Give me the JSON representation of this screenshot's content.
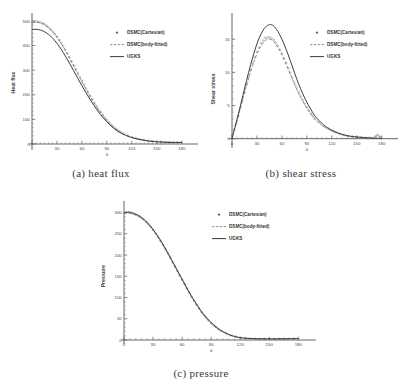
{
  "figure": {
    "background": "#ffffff",
    "legend_labels": [
      "DSMC(Cartesian)",
      "DSMC(body-fitted)",
      "UGKS"
    ],
    "series_colors": {
      "dsmc_cartesian": "#8a8a8a",
      "dsmc_body_fitted": "#6a6a6a",
      "ugks": "#3c3c3c"
    }
  },
  "panels": [
    {
      "id": "a",
      "caption": "(a)  heat flux"
    },
    {
      "id": "b",
      "caption": "(b)  shear stress"
    },
    {
      "id": "c",
      "caption": "(c)  pressure"
    }
  ],
  "chart_data": [
    {
      "type": "line",
      "panel": "a",
      "title": "",
      "caption": "(a)  heat flux",
      "xlabel": "θ",
      "ylabel": "Heat flux",
      "xlim": [
        0,
        190
      ],
      "ylim": [
        0,
        520
      ],
      "xticks": [
        0,
        30,
        60,
        90,
        120,
        150,
        180
      ],
      "yticks": [
        0,
        100,
        200,
        300,
        400,
        500
      ],
      "xtick_labels": [
        "0",
        "30",
        "60",
        "90",
        "120",
        "150",
        "180"
      ],
      "ytick_labels": [
        "0",
        "100",
        "200",
        "300",
        "400",
        "500"
      ],
      "minor_ticks_per_interval": 6,
      "grid": false,
      "legend_position": "upper-right",
      "x": [
        0,
        5,
        10,
        15,
        20,
        25,
        30,
        35,
        40,
        45,
        50,
        55,
        60,
        65,
        70,
        75,
        80,
        85,
        90,
        95,
        100,
        105,
        110,
        120,
        130,
        140,
        150,
        160,
        170,
        180
      ],
      "series": [
        {
          "name": "DSMC(Cartesian)",
          "style": "points",
          "values": [
            497,
            498,
            494,
            487,
            474,
            457,
            436,
            411,
            383,
            352,
            320,
            288,
            256,
            225,
            195,
            167,
            141,
            118,
            97,
            79,
            64,
            52,
            42,
            28,
            19,
            13,
            10,
            8,
            7,
            7
          ]
        },
        {
          "name": "DSMC(body-fitted)",
          "style": "dashed",
          "values": [
            492,
            495,
            492,
            485,
            472,
            455,
            434,
            409,
            381,
            350,
            318,
            286,
            254,
            223,
            194,
            166,
            140,
            117,
            96,
            78,
            63,
            51,
            41,
            27,
            18,
            13,
            10,
            8,
            7,
            7
          ]
        },
        {
          "name": "UGKS",
          "style": "solid",
          "values": [
            465,
            466,
            463,
            456,
            445,
            429,
            409,
            385,
            358,
            329,
            298,
            267,
            237,
            208,
            180,
            154,
            130,
            109,
            90,
            73,
            59,
            48,
            39,
            26,
            18,
            12,
            9,
            7,
            6,
            6
          ]
        }
      ]
    },
    {
      "type": "line",
      "panel": "b",
      "title": "",
      "caption": "(b)  shear stress",
      "xlabel": "θ",
      "ylabel": "Shear stress",
      "xlim": [
        0,
        190
      ],
      "ylim": [
        -0.8,
        18.5
      ],
      "xticks": [
        0,
        30,
        60,
        90,
        120,
        150,
        180
      ],
      "yticks": [
        0,
        5,
        10,
        15
      ],
      "xtick_labels": [
        "0",
        "30",
        "60",
        "90",
        "120",
        "150",
        "180"
      ],
      "ytick_labels": [
        "0",
        "5",
        "10",
        "15"
      ],
      "minor_ticks_per_interval": 5,
      "grid": false,
      "legend_position": "upper-right",
      "x": [
        0,
        5,
        10,
        15,
        20,
        25,
        30,
        35,
        40,
        45,
        50,
        55,
        60,
        65,
        70,
        75,
        80,
        85,
        90,
        95,
        100,
        110,
        120,
        130,
        140,
        150,
        160,
        170,
        175,
        180
      ],
      "series": [
        {
          "name": "DSMC(Cartesian)",
          "style": "points",
          "values": [
            0.5,
            2.3,
            4.6,
            7.0,
            9.3,
            11.4,
            13.1,
            14.4,
            15.2,
            15.3,
            14.9,
            14.0,
            12.8,
            11.4,
            9.9,
            8.4,
            7.0,
            5.8,
            4.7,
            3.8,
            3.0,
            1.9,
            1.2,
            0.7,
            0.4,
            0.25,
            0.15,
            0.1,
            0.6,
            0.05
          ]
        },
        {
          "name": "DSMC(body-fitted)",
          "style": "dashed",
          "values": [
            0.4,
            2.2,
            4.5,
            6.9,
            9.1,
            11.1,
            12.8,
            14.0,
            14.8,
            15.0,
            14.7,
            13.8,
            12.7,
            11.3,
            9.8,
            8.3,
            6.9,
            5.7,
            4.6,
            3.7,
            2.9,
            1.85,
            1.15,
            0.68,
            0.38,
            0.24,
            0.14,
            0.09,
            0.5,
            0.05
          ]
        },
        {
          "name": "UGKS",
          "style": "solid",
          "values": [
            0.0,
            2.4,
            4.9,
            7.5,
            10.0,
            12.3,
            14.3,
            15.8,
            16.8,
            17.2,
            17.0,
            16.2,
            15.0,
            13.5,
            11.8,
            10.0,
            8.3,
            6.8,
            5.5,
            4.4,
            3.4,
            2.1,
            1.3,
            0.75,
            0.42,
            0.26,
            0.15,
            0.08,
            0.05,
            0.02
          ]
        }
      ]
    },
    {
      "type": "line",
      "panel": "c",
      "title": "",
      "caption": "(c)  pressure",
      "xlabel": "θ",
      "ylabel": "Pressure",
      "xlim": [
        0,
        190
      ],
      "ylim": [
        0,
        320
      ],
      "xticks": [
        0,
        30,
        60,
        90,
        120,
        150,
        180
      ],
      "yticks": [
        0,
        50,
        100,
        150,
        200,
        250,
        300
      ],
      "xtick_labels": [
        "0",
        "30",
        "60",
        "90",
        "120",
        "150",
        "180"
      ],
      "ytick_labels": [
        "0",
        "50",
        "100",
        "150",
        "200",
        "250",
        "300"
      ],
      "minor_ticks_per_interval": 5,
      "grid": false,
      "legend_position": "upper-right",
      "x": [
        0,
        5,
        10,
        15,
        20,
        25,
        30,
        35,
        40,
        45,
        50,
        55,
        60,
        65,
        70,
        75,
        80,
        85,
        90,
        95,
        100,
        110,
        120,
        130,
        140,
        150,
        160,
        170,
        180
      ],
      "series": [
        {
          "name": "DSMC(Cartesian)",
          "style": "points",
          "values": [
            299,
            300,
            297,
            292,
            284,
            273,
            259,
            243,
            225,
            205,
            184,
            163,
            142,
            121,
            101,
            83,
            66,
            52,
            40,
            30,
            22,
            11,
            5.5,
            3.5,
            2.8,
            2.6,
            2.7,
            3.0,
            3.4
          ]
        },
        {
          "name": "DSMC(body-fitted)",
          "style": "dashed",
          "values": [
            298,
            299,
            296,
            291,
            283,
            272,
            258,
            242,
            224,
            204,
            183,
            162,
            141,
            120,
            100,
            82,
            65,
            51,
            39,
            29,
            21.5,
            10.8,
            5.3,
            3.4,
            2.7,
            2.5,
            2.6,
            2.9,
            3.3
          ]
        },
        {
          "name": "UGKS",
          "style": "solid",
          "values": [
            300,
            301,
            298,
            293,
            285,
            274,
            260,
            244,
            226,
            206,
            185,
            164,
            143,
            122,
            102,
            84,
            67,
            53,
            41,
            31,
            22.5,
            11.2,
            5.6,
            3.6,
            2.9,
            2.7,
            2.8,
            3.1,
            3.5
          ]
        }
      ]
    }
  ]
}
